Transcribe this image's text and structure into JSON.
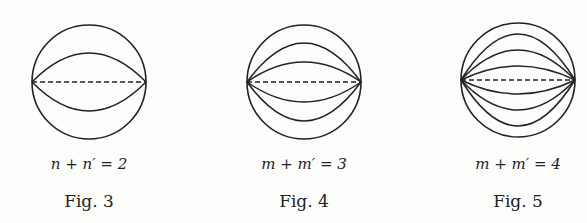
{
  "figures": [
    {
      "label": "Fig. 3",
      "formula": "n + n′ = 2",
      "cx": 89,
      "cy": 82,
      "r": 57,
      "arc_offsets": [
        29
      ]
    },
    {
      "label": "Fig. 4",
      "formula": "m + m′ = 3",
      "cx": 304,
      "cy": 82,
      "r": 57,
      "arc_offsets": [
        20,
        39
      ]
    },
    {
      "label": "Fig. 5",
      "formula": "m + m′ = 4",
      "cx": 518,
      "cy": 80,
      "r": 57,
      "arc_offsets": [
        14,
        30,
        46
      ]
    }
  ],
  "colors": {
    "ink": "#222222",
    "paper": "#fdfdfb"
  }
}
